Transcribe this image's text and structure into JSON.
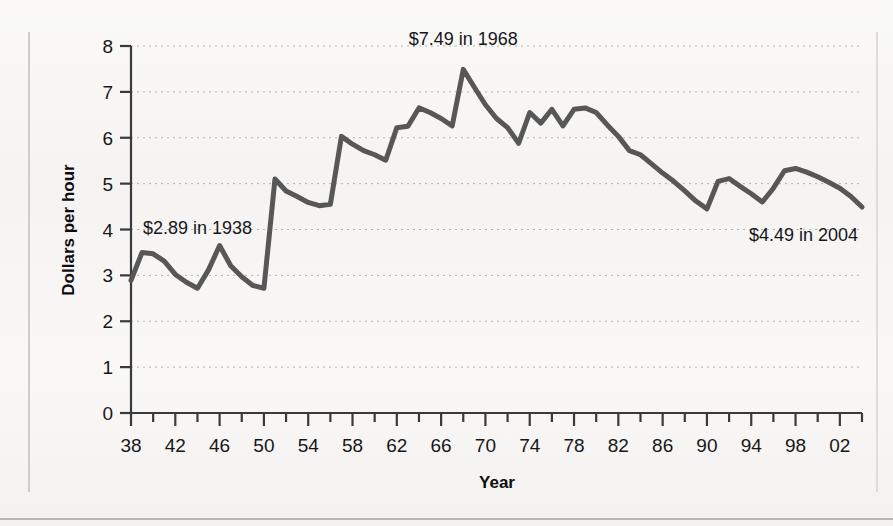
{
  "chart_data": {
    "type": "line",
    "title": "",
    "subtitle": "",
    "xlabel": "Year",
    "ylabel": "Dollars per hour",
    "xlim": [
      1938,
      2004
    ],
    "ylim": [
      0,
      8
    ],
    "grid": true,
    "grid_axis": "y",
    "legend": false,
    "legend_position": "none",
    "y_ticks": [
      0,
      1,
      2,
      3,
      4,
      5,
      6,
      7,
      8
    ],
    "y_tick_labels": [
      "0",
      "1",
      "2",
      "3",
      "4",
      "5",
      "6",
      "7",
      "8"
    ],
    "x_ticks": [
      1938,
      1942,
      1946,
      1950,
      1954,
      1958,
      1962,
      1966,
      1970,
      1974,
      1978,
      1982,
      1986,
      1990,
      1994,
      1998,
      2002
    ],
    "x_tick_labels": [
      "38",
      "42",
      "46",
      "50",
      "54",
      "58",
      "62",
      "66",
      "70",
      "74",
      "78",
      "82",
      "86",
      "90",
      "94",
      "98",
      "02"
    ],
    "x_minor_tick_interval": 2,
    "line_color": "#575757",
    "line_width": 5,
    "series": [
      {
        "name": "Minimum wage in constant dollars",
        "x": [
          1938,
          1939,
          1940,
          1941,
          1942,
          1943,
          1944,
          1945,
          1946,
          1947,
          1948,
          1949,
          1950,
          1951,
          1952,
          1953,
          1954,
          1955,
          1956,
          1957,
          1958,
          1959,
          1960,
          1961,
          1962,
          1963,
          1964,
          1965,
          1966,
          1967,
          1968,
          1969,
          1970,
          1971,
          1972,
          1973,
          1974,
          1975,
          1976,
          1977,
          1978,
          1979,
          1980,
          1981,
          1982,
          1983,
          1984,
          1985,
          1986,
          1987,
          1988,
          1989,
          1990,
          1991,
          1992,
          1993,
          1994,
          1995,
          1996,
          1997,
          1998,
          1999,
          2000,
          2001,
          2002,
          2003,
          2004
        ],
        "values": [
          2.89,
          3.5,
          3.47,
          3.31,
          3.02,
          2.85,
          2.72,
          3.12,
          3.65,
          3.21,
          2.97,
          2.78,
          2.72,
          5.1,
          4.84,
          4.72,
          4.59,
          4.52,
          4.55,
          6.03,
          5.86,
          5.72,
          5.63,
          5.51,
          6.22,
          6.25,
          6.65,
          6.55,
          6.42,
          6.26,
          7.49,
          7.1,
          6.72,
          6.42,
          6.22,
          5.88,
          6.55,
          6.32,
          6.62,
          6.26,
          6.62,
          6.65,
          6.55,
          6.28,
          6.03,
          5.72,
          5.63,
          5.43,
          5.23,
          5.05,
          4.84,
          4.62,
          4.45,
          5.05,
          5.11,
          4.94,
          4.78,
          4.6,
          4.9,
          5.28,
          5.33,
          5.25,
          5.15,
          5.03,
          4.9,
          4.72,
          4.49
        ]
      }
    ],
    "annotations": [
      {
        "label": "$2.89 in 1938",
        "x": 1938,
        "y": 2.89,
        "align": "left"
      },
      {
        "label": "$7.49 in 1968",
        "x": 1968,
        "y": 7.49,
        "align": "center"
      },
      {
        "label": "$4.49 in 2004",
        "x": 2004,
        "y": 4.49,
        "align": "right"
      }
    ]
  }
}
